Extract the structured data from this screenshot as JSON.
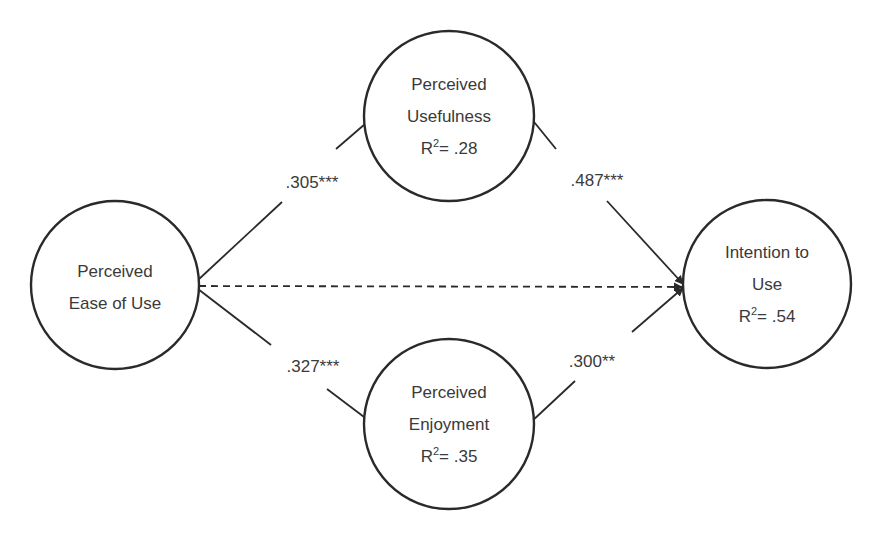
{
  "diagram": {
    "type": "path-model",
    "nodes": [
      {
        "id": "peou",
        "lines": [
          "Perceived",
          "Ease of Use"
        ],
        "r2": null,
        "cx": 115,
        "cy": 285,
        "r": 84
      },
      {
        "id": "pu",
        "lines": [
          "Perceived",
          "Usefulness"
        ],
        "r2_prefix": "R",
        "r2_sup": "2",
        "r2_value": "= .28",
        "cx": 449,
        "cy": 116,
        "r": 85
      },
      {
        "id": "pe",
        "lines": [
          "Perceived",
          "Enjoyment"
        ],
        "r2_prefix": "R",
        "r2_sup": "2",
        "r2_value": "= .35",
        "cx": 449,
        "cy": 424,
        "r": 85
      },
      {
        "id": "itu",
        "lines": [
          "Intention to",
          "Use"
        ],
        "r2_prefix": "R",
        "r2_sup": "2",
        "r2_value": "= .54",
        "cx": 767,
        "cy": 284,
        "r": 84
      }
    ],
    "edges": [
      {
        "from": "peou",
        "to": "pu",
        "label": ".305***",
        "style": "solid"
      },
      {
        "from": "pu",
        "to": "itu",
        "label": ".487***",
        "style": "solid"
      },
      {
        "from": "peou",
        "to": "pe",
        "label": ".327***",
        "style": "solid"
      },
      {
        "from": "pe",
        "to": "itu",
        "label": ".300**",
        "style": "solid"
      },
      {
        "from": "peou",
        "to": "itu",
        "label": "",
        "style": "dashed"
      }
    ]
  },
  "colors": {
    "stroke": "#2a2a2a",
    "text": "#3a3a3a",
    "background": "#ffffff"
  }
}
